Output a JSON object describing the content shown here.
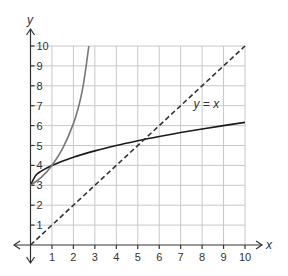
{
  "chart_data": {
    "type": "line",
    "title": "",
    "xlabel": "x",
    "ylabel": "y",
    "xlim": [
      0,
      10
    ],
    "ylim": [
      0,
      10
    ],
    "grid": true,
    "x_ticks": [
      "1",
      "2",
      "3",
      "4",
      "5",
      "6",
      "7",
      "8",
      "9",
      "10"
    ],
    "y_ticks": [
      "1",
      "2",
      "3",
      "4",
      "5",
      "6",
      "7",
      "8",
      "9",
      "10"
    ],
    "annotations": [
      {
        "text": "y = x",
        "x": 7.6,
        "y": 6.9
      }
    ],
    "series": [
      {
        "name": "black curve",
        "color": "#1a1a1a",
        "style": "solid",
        "points": [
          [
            0,
            3
          ],
          [
            0.25,
            3.5
          ],
          [
            0.5,
            3.71
          ],
          [
            1,
            4
          ],
          [
            2,
            4.41
          ],
          [
            3,
            4.73
          ],
          [
            4,
            5
          ],
          [
            5,
            5.24
          ],
          [
            5.5,
            5.35
          ],
          [
            6,
            5.45
          ],
          [
            7,
            5.65
          ],
          [
            8,
            5.83
          ],
          [
            9,
            6
          ],
          [
            10,
            6.16
          ]
        ]
      },
      {
        "name": "gray curve",
        "color": "#777777",
        "style": "solid",
        "points": [
          [
            0,
            3
          ],
          [
            0.5,
            3.4
          ],
          [
            1,
            4
          ],
          [
            1.5,
            4.85
          ],
          [
            2,
            6.1
          ],
          [
            2.3,
            7.2
          ],
          [
            2.5,
            8.3
          ],
          [
            2.72,
            10
          ]
        ]
      },
      {
        "name": "y = x",
        "color": "#333333",
        "style": "dashed",
        "points": [
          [
            0,
            0
          ],
          [
            10,
            10
          ]
        ]
      }
    ]
  }
}
